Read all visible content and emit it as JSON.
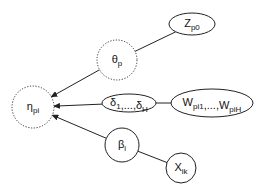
{
  "diagram": {
    "title": "",
    "nodes": [
      {
        "id": "eta",
        "main": "η",
        "sub": "pi",
        "shape": "circle",
        "style": "dotted",
        "kind": "latent"
      },
      {
        "id": "theta",
        "main": "θ",
        "sub": "p",
        "shape": "circle",
        "style": "dotted",
        "kind": "latent"
      },
      {
        "id": "z",
        "main": "Z",
        "sub": "p0",
        "shape": "ellipse",
        "style": "solid",
        "kind": "observed"
      },
      {
        "id": "delta",
        "text": "δ₁,...,δ_H",
        "parts": [
          {
            "main": "δ",
            "sub": "1"
          },
          {
            "main": ",...,δ",
            "sub": "H"
          }
        ],
        "shape": "ellipse",
        "style": "solid",
        "kind": "parameter"
      },
      {
        "id": "w",
        "parts": [
          {
            "main": "W",
            "sub": "pi1"
          },
          {
            "main": ",...,W",
            "sub": "piH"
          }
        ],
        "shape": "ellipse",
        "style": "solid",
        "kind": "observed"
      },
      {
        "id": "beta",
        "main": "β",
        "sub": "i",
        "shape": "circle",
        "style": "solid",
        "kind": "parameter"
      },
      {
        "id": "x",
        "main": "X",
        "sub": "ik",
        "shape": "circle",
        "style": "solid",
        "kind": "observed"
      }
    ],
    "edges": [
      {
        "from": "z",
        "to": "theta",
        "arrow": false
      },
      {
        "from": "theta",
        "to": "eta",
        "arrow": true
      },
      {
        "from": "w",
        "to": "delta",
        "arrow": false
      },
      {
        "from": "delta",
        "to": "eta",
        "arrow": true
      },
      {
        "from": "x",
        "to": "beta",
        "arrow": false
      },
      {
        "from": "beta",
        "to": "eta",
        "arrow": true
      }
    ],
    "colors": {
      "stroke": "#222222",
      "background": "#ffffff"
    }
  }
}
